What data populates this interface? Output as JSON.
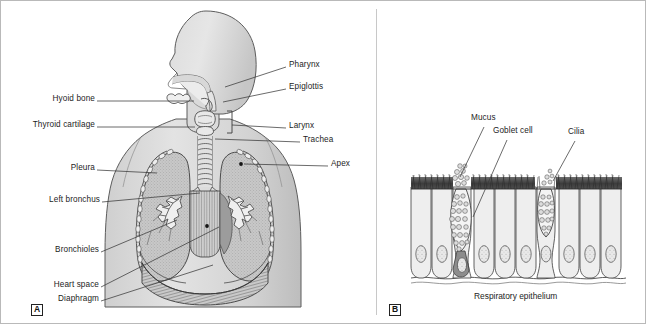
{
  "figure": {
    "background_color": "#ffffff",
    "border_color": "#b9b9b9",
    "line_color": "#3a3a3a",
    "body_fill": "#d2d2d2",
    "body_fill_light": "#dedede",
    "lung_fill": "#c4c4c4",
    "mediastinum_fill": "#9a9a9a",
    "cell_fill": "#ededed",
    "nucleus_fill": "#9d9d9d",
    "cilia_fill": "#4a4a4a"
  },
  "panel_a": {
    "tag": "A",
    "labels_left": [
      {
        "text": "Hyoid bone",
        "x": 52,
        "y": 97,
        "line_to_x": 193,
        "line_to_y": 100
      },
      {
        "text": "Thyroid cartilage",
        "x": 33,
        "y": 124,
        "line_to_x": 194,
        "line_to_y": 126
      },
      {
        "text": "Pleura",
        "x": 74,
        "y": 166,
        "line_to_x": 155,
        "line_to_y": 170
      },
      {
        "text": "Left bronchus",
        "x": 50,
        "y": 198,
        "line_to_x": 199,
        "line_to_y": 192
      },
      {
        "text": "Bronchioles",
        "x": 57,
        "y": 248,
        "line_to_x": 176,
        "line_to_y": 219
      },
      {
        "text": "Heart space",
        "x": 55,
        "y": 283,
        "line_to_x": 216,
        "line_to_y": 225
      },
      {
        "text": "Diaphragm",
        "x": 61,
        "y": 297,
        "line_to_x": 210,
        "line_to_y": 262
      }
    ],
    "labels_right": [
      {
        "text": "Pharynx",
        "x": 288,
        "y": 64,
        "line_to_x": 224,
        "line_to_y": 85
      },
      {
        "text": "Epiglottis",
        "x": 288,
        "y": 85,
        "line_to_x": 222,
        "line_to_y": 100
      },
      {
        "text": "Larynx",
        "x": 288,
        "y": 124,
        "line_to_x": 236,
        "line_to_y": 124
      },
      {
        "text": "Trachea",
        "x": 302,
        "y": 139,
        "line_to_x": 214,
        "line_to_y": 137
      },
      {
        "text": "Apex",
        "x": 330,
        "y": 163,
        "line_to_x": 248,
        "line_to_y": 160
      }
    ]
  },
  "panel_b": {
    "tag": "B",
    "caption": "Respiratory epithelium",
    "labels": [
      {
        "text": "Mucus",
        "x": 472,
        "y": 118,
        "line_to_x": 457,
        "line_to_y": 186
      },
      {
        "text": "Goblet cell",
        "x": 494,
        "y": 130,
        "line_to_x": 473,
        "line_to_y": 215
      },
      {
        "text": "Cilia",
        "x": 569,
        "y": 131,
        "line_to_x": 551,
        "line_to_y": 183
      }
    ],
    "cell_count": 13,
    "goblet_cell_count": 2
  }
}
